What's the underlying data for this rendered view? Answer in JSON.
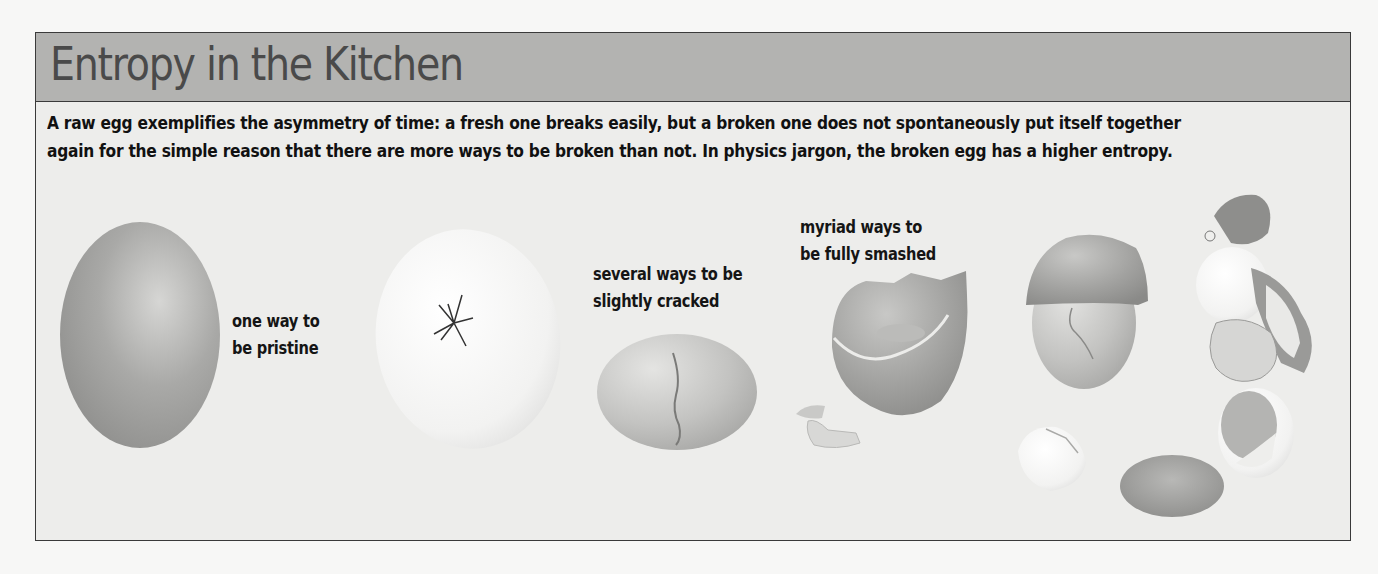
{
  "figure": {
    "title": "Entropy in the Kitchen",
    "caption": {
      "line1": "A raw egg exemplifies the asymmetry of time: a fresh one breaks easily, but a broken one does not spontaneously put itself together",
      "line2": "again for the simple reason that there are more ways to be broken than not. In physics jargon, the broken egg has a higher entropy."
    },
    "labels": {
      "pristine": {
        "line1": "one way to",
        "line2": "be pristine"
      },
      "cracked": {
        "line1": "several ways to be",
        "line2": "slightly cracked"
      },
      "smashed": {
        "line1": "myriad ways to",
        "line2": "be fully smashed"
      }
    },
    "illustrations": [
      {
        "name": "pristine-egg",
        "state": "pristine"
      },
      {
        "name": "cracked-egg-star",
        "state": "slightly cracked"
      },
      {
        "name": "cracked-egg-line",
        "state": "slightly cracked"
      },
      {
        "name": "open-shell-egg",
        "state": "fully smashed"
      },
      {
        "name": "capped-broken-egg",
        "state": "fully smashed"
      },
      {
        "name": "crushed-egg-pile",
        "state": "fully smashed"
      },
      {
        "name": "shell-fragments",
        "state": "fully smashed"
      },
      {
        "name": "yolk-and-shell-halves",
        "state": "fully smashed"
      }
    ],
    "colors": {
      "header_bg": "#b3b3b1",
      "panel_bg": "#ededeb",
      "border": "#3a3a3a",
      "title_text": "#4a4a4a",
      "body_text": "#111111"
    }
  }
}
